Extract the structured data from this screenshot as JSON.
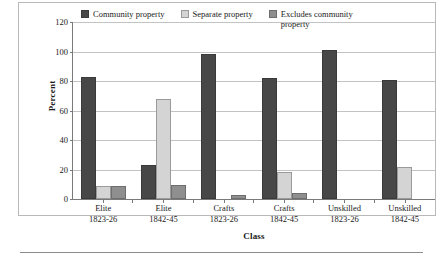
{
  "chart_data": {
    "type": "bar",
    "title": "",
    "xlabel": "Class",
    "ylabel": "Percent",
    "ylim": [
      0,
      120
    ],
    "yticks": [
      0,
      20,
      40,
      60,
      80,
      100,
      120
    ],
    "grid": true,
    "legend_position": "top-inside",
    "categories": [
      "Elite\n1823-26",
      "Elite\n1842-45",
      "Crafts\n1823-26",
      "Crafts\n1842-45",
      "Unskilled\n1823-26",
      "Unskilled\n1842-45"
    ],
    "category_lines": [
      {
        "line1": "Elite",
        "line2": "1823-26"
      },
      {
        "line1": "Elite",
        "line2": "1842-45"
      },
      {
        "line1": "Crafts",
        "line2": "1823-26"
      },
      {
        "line1": "Crafts",
        "line2": "1842-45"
      },
      {
        "line1": "Unskilled",
        "line2": "1823-26"
      },
      {
        "line1": "Unskilled",
        "line2": "1842-45"
      }
    ],
    "series": [
      {
        "name": "Community property",
        "color": "#474747",
        "values": [
          83,
          23,
          98,
          82,
          101,
          81
        ]
      },
      {
        "name": "Separate property",
        "color": "#d4d4d4",
        "values": [
          9,
          68,
          0,
          18,
          0,
          21.5
        ]
      },
      {
        "name": "Excludes community property",
        "color": "#8f8f8f",
        "values": [
          9,
          9.5,
          3,
          4,
          0,
          0
        ]
      }
    ]
  },
  "legend": {
    "items": [
      {
        "label": "Community property",
        "color": "#474747"
      },
      {
        "label": "Separate property",
        "color": "#d4d4d4"
      },
      {
        "label": "Excludes community property",
        "color": "#8f8f8f"
      }
    ]
  },
  "axes": {
    "y_title": "Percent",
    "x_title": "Class",
    "y_tick_labels": [
      "0",
      "20",
      "40",
      "60",
      "80",
      "100",
      "120"
    ]
  }
}
